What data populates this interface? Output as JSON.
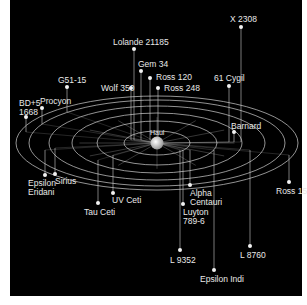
{
  "diagram": {
    "colors": {
      "background": "#000000",
      "lines": "#d8d8d8",
      "stars": "#f2f2f2",
      "sun": "#ffffff",
      "page": "#ffffff"
    },
    "center": {
      "label": "Haul",
      "x": 147,
      "y": 143
    },
    "orbits": [
      {
        "rx": 33,
        "ry": 12
      },
      {
        "rx": 60,
        "ry": 22
      },
      {
        "rx": 85,
        "ry": 30
      },
      {
        "rx": 108,
        "ry": 37
      },
      {
        "rx": 128,
        "ry": 43
      },
      {
        "rx": 141,
        "ry": 47
      }
    ],
    "stars": [
      {
        "name": "X 2308",
        "x": 231,
        "y": 27,
        "lx": 220,
        "ly": 15,
        "lines": [
          "X 2308"
        ],
        "stem_to": 142
      },
      {
        "name": "Lolande 21185",
        "x": 124,
        "y": 49,
        "lx": 103,
        "ly": 38,
        "lines": [
          "Lolande 21185"
        ],
        "stem_to": 140
      },
      {
        "name": "Gem 34",
        "x": 131,
        "y": 71,
        "lx": 128,
        "ly": 60,
        "lines": [
          "Gem 34"
        ],
        "stem_to": 140
      },
      {
        "name": "Ross 120",
        "x": 140,
        "y": 78,
        "lx": 146,
        "ly": 73,
        "lines": [
          "Ross 120"
        ],
        "stem_to": 140
      },
      {
        "name": "Ross 248",
        "x": 148,
        "y": 88,
        "lx": 154,
        "ly": 84,
        "lines": [
          "Ross 248"
        ],
        "stem_to": 140
      },
      {
        "name": "Wolf 350",
        "x": 121,
        "y": 88,
        "lx": 91,
        "ly": 84,
        "lines": [
          "Wolf 350"
        ],
        "stem_to": 140
      },
      {
        "name": "61 Cygil",
        "x": 219,
        "y": 86,
        "lx": 204,
        "ly": 74,
        "lines": [
          "61 Cygil"
        ],
        "stem_to": 142
      },
      {
        "name": "G51-15",
        "x": 57,
        "y": 87,
        "lx": 48,
        "ly": 76,
        "lines": [
          "G51-15"
        ],
        "stem_to": 112
      },
      {
        "name": "Procyon",
        "x": 32,
        "y": 108,
        "lx": 30,
        "ly": 97,
        "lines": [
          "Procyon"
        ],
        "stem_to": 124
      },
      {
        "name": "BD+5 1668",
        "x": 16,
        "y": 117,
        "lx": 9,
        "ly": 99,
        "lines": [
          "BD+5",
          "1668"
        ],
        "stem_to": 132
      },
      {
        "name": "Barnard",
        "x": 224,
        "y": 132,
        "lx": 221,
        "ly": 122,
        "lines": [
          "Barnard"
        ],
        "stem_to": 142
      },
      {
        "name": "Epsilon Eridani",
        "x": 35,
        "y": 175,
        "lx": 18,
        "ly": 179,
        "lines": [
          "Epsilon",
          "Eridani"
        ],
        "stem_to": 150
      },
      {
        "name": "Sirius",
        "x": 45,
        "y": 174,
        "lx": 45,
        "ly": 177,
        "lines": [
          "Sirius"
        ],
        "stem_to": 148
      },
      {
        "name": "UV Ceti",
        "x": 103,
        "y": 193,
        "lx": 102,
        "ly": 196,
        "lines": [
          "UV Ceti"
        ],
        "stem_to": 155
      },
      {
        "name": "Tau Ceti",
        "x": 88,
        "y": 203,
        "lx": 74,
        "ly": 208,
        "lines": [
          "Tau Ceti"
        ],
        "stem_to": 160
      },
      {
        "name": "Alpha Centauri",
        "x": 180,
        "y": 185,
        "lx": 180,
        "ly": 189,
        "lines": [
          "Alpha",
          "Centauri"
        ],
        "stem_to": 150
      },
      {
        "name": "Luyton 789-6",
        "x": 173,
        "y": 204,
        "lx": 173,
        "ly": 208,
        "lines": [
          "Luyton",
          "789-6"
        ],
        "stem_to": 150
      },
      {
        "name": "Ross 154",
        "x": 279,
        "y": 182,
        "lx": 266,
        "ly": 187,
        "lines": [
          "Ross 154"
        ],
        "stem_to": 155
      },
      {
        "name": "L 9352",
        "x": 170,
        "y": 250,
        "lx": 160,
        "ly": 256,
        "lines": [
          "L 9352"
        ],
        "stem_to": 150
      },
      {
        "name": "L 8760",
        "x": 240,
        "y": 246,
        "lx": 230,
        "ly": 251,
        "lines": [
          "L 8760"
        ],
        "stem_to": 150
      },
      {
        "name": "Epsilon Indi",
        "x": 204,
        "y": 270,
        "lx": 190,
        "ly": 275,
        "lines": [
          "Epsilon Indi"
        ],
        "stem_to": 150
      }
    ]
  }
}
